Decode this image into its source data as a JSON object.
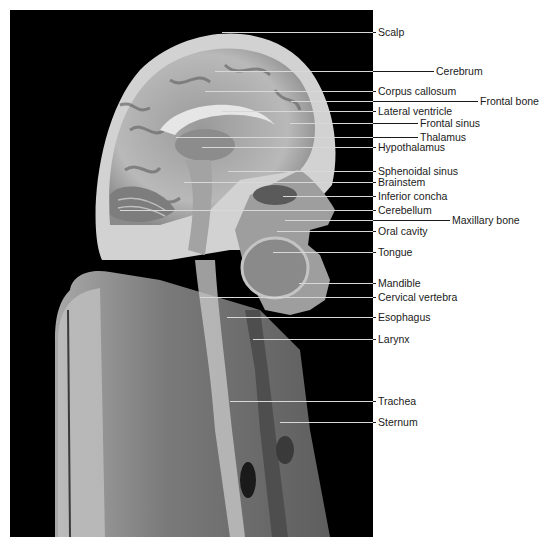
{
  "figure": {
    "colors": {
      "background": "#000000",
      "page": "#ffffff",
      "leader_on_image": "#d8d8d8",
      "leader_off_image": "#1a1a1a",
      "label_text": "#1a1a1a"
    },
    "labels": [
      {
        "text": "Scalp",
        "y": 32,
        "x_start": 222,
        "label_x": 378
      },
      {
        "text": "Cerebrum",
        "y": 71,
        "x_start": 215,
        "label_x": 436
      },
      {
        "text": "Corpus callosum",
        "y": 91,
        "x_start": 205,
        "label_x": 378
      },
      {
        "text": "Frontal bone",
        "y": 101,
        "x_start": 291,
        "label_x": 480
      },
      {
        "text": "Lateral ventricle",
        "y": 111,
        "x_start": 222,
        "label_x": 378
      },
      {
        "text": "Frontal sinus",
        "y": 123,
        "x_start": 290,
        "label_x": 420
      },
      {
        "text": "Thalamus",
        "y": 137,
        "x_start": 176,
        "label_x": 420
      },
      {
        "text": "Hypothalamus",
        "y": 147,
        "x_start": 202,
        "label_x": 378
      },
      {
        "text": "Sphenoidal sinus",
        "y": 171,
        "x_start": 228,
        "label_x": 378
      },
      {
        "text": "Brainstem",
        "y": 182,
        "x_start": 184,
        "label_x": 378
      },
      {
        "text": "Inferior concha",
        "y": 196,
        "x_start": 283,
        "label_x": 378
      },
      {
        "text": "Cerebellum",
        "y": 210,
        "x_start": 120,
        "label_x": 378
      },
      {
        "text": "Maxillary bone",
        "y": 220,
        "x_start": 285,
        "label_x": 452
      },
      {
        "text": "Oral cavity",
        "y": 231,
        "x_start": 277,
        "label_x": 378
      },
      {
        "text": "Tongue",
        "y": 252,
        "x_start": 273,
        "label_x": 378
      },
      {
        "text": "Mandible",
        "y": 283,
        "x_start": 299,
        "label_x": 378
      },
      {
        "text": "Cervical vertebra",
        "y": 297,
        "x_start": 200,
        "label_x": 378
      },
      {
        "text": "Esophagus",
        "y": 317,
        "x_start": 227,
        "label_x": 378
      },
      {
        "text": "Larynx",
        "y": 339,
        "x_start": 253,
        "label_x": 378
      },
      {
        "text": "Trachea",
        "y": 401,
        "x_start": 230,
        "label_x": 378
      },
      {
        "text": "Sternum",
        "y": 422,
        "x_start": 280,
        "label_x": 378
      }
    ]
  }
}
